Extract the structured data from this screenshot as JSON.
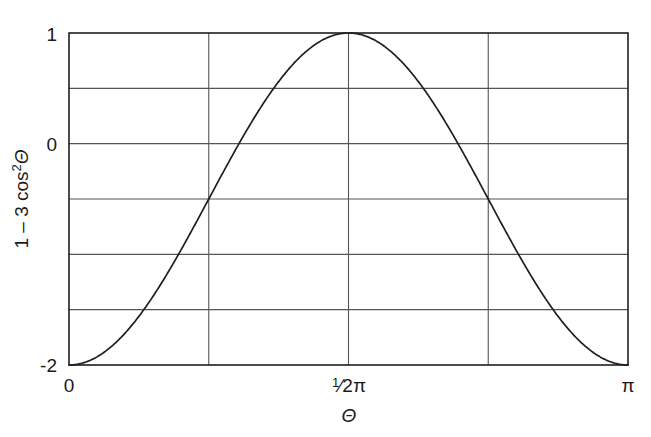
{
  "figure": {
    "background_color": "#ffffff",
    "line_color": "#1f1f1f",
    "grid_color": "#555555",
    "frame_color": "#1f1f1f"
  },
  "axes": {
    "y_label": "1 − 3 cos² Θ",
    "y_label_parts": {
      "lead": "1 – 3 cos",
      "superscript": "2",
      "variable": "Θ"
    },
    "x_label": "Θ",
    "y_ticks": [
      {
        "value": 1,
        "label": "1"
      },
      {
        "value": 0,
        "label": "0"
      },
      {
        "value": -2,
        "label": "-2"
      }
    ],
    "y_gridlines": [
      1,
      0.5,
      0,
      -0.5,
      -1,
      -1.5,
      -2
    ],
    "x_ticks": [
      {
        "value": 0,
        "label": "0"
      },
      {
        "value": 1.5707963,
        "label": "1/2π",
        "label_num": "1",
        "label_den": "2π"
      },
      {
        "value": 3.1415927,
        "label": "π"
      }
    ],
    "x_gridlines": [
      0,
      0.7853982,
      1.5707963,
      2.3561945,
      3.1415927
    ]
  },
  "chart_data": {
    "type": "line",
    "title": "",
    "xlabel": "Θ",
    "ylabel": "1 − 3 cos² Θ",
    "xlim": [
      0,
      3.1415927
    ],
    "ylim": [
      -2,
      1
    ],
    "xtick_labels": [
      "0",
      "½π",
      "π"
    ],
    "xtick_values": [
      0,
      1.5707963,
      3.1415927
    ],
    "ytick_labels": [
      "1",
      "0",
      "-2"
    ],
    "ytick_values": [
      1,
      0,
      -2
    ],
    "grid": true,
    "legend": "none",
    "function": "y = 1 - 3*cos(theta)^2",
    "series": [
      {
        "name": "1 - 3 cos^2 Θ",
        "x": [
          0.0,
          0.1047,
          0.2094,
          0.3142,
          0.4189,
          0.5236,
          0.6283,
          0.733,
          0.8378,
          0.9425,
          1.0472,
          1.1519,
          1.2566,
          1.3614,
          1.4661,
          1.5708,
          1.6755,
          1.7802,
          1.885,
          1.9897,
          2.0944,
          2.1991,
          2.3038,
          2.4086,
          2.5133,
          2.618,
          2.7227,
          2.8274,
          2.9322,
          3.0369,
          3.1416
        ],
        "values": [
          -2.0,
          -1.9708,
          -1.8838,
          -1.7426,
          -1.5528,
          -1.3229,
          -1.0633,
          -0.7859,
          -0.5037,
          -0.2298,
          0.0225,
          0.241,
          0.4157,
          0.5392,
          0.6074,
          0.6196,
          -99,
          -99,
          -99,
          -99,
          -99,
          -99,
          -99,
          -99,
          -99,
          -99,
          -99,
          -99,
          -99,
          -99,
          -2.0
        ]
      }
    ],
    "key_points": [
      {
        "x": 0,
        "y": -2,
        "note": "minimum at theta = 0"
      },
      {
        "x": 0.9553,
        "y": 0,
        "note": "zero crossing, cos^2 = 1/3"
      },
      {
        "x": 1.5708,
        "y": 1,
        "note": "maximum at theta = 1/2 pi"
      },
      {
        "x": 2.1863,
        "y": 0,
        "note": "zero crossing"
      },
      {
        "x": 3.1416,
        "y": -2,
        "note": "minimum at theta = pi"
      }
    ]
  }
}
